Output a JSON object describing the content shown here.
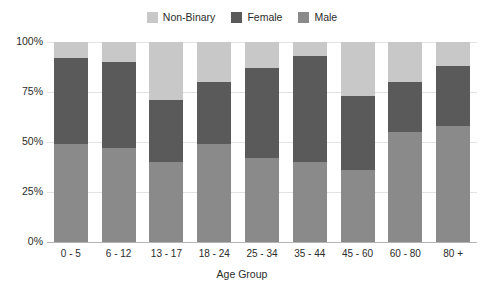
{
  "chart_data": {
    "type": "bar",
    "subtype": "stacked-bar-100-percent",
    "title": "",
    "xlabel": "Age Group",
    "ylabel": "",
    "ylim": [
      0,
      100
    ],
    "yticks": [
      "0%",
      "25%",
      "50%",
      "75%",
      "100%"
    ],
    "ytick_values": [
      0,
      25,
      50,
      75,
      100
    ],
    "grid": true,
    "legend_position": "top-center",
    "categories": [
      "0 - 5",
      "6 - 12",
      "13 - 17",
      "18 - 24",
      "25 - 34",
      "35 - 44",
      "45 - 60",
      "60 - 80",
      "80 +"
    ],
    "series": [
      {
        "name": "Male",
        "color": "#8a8a8a",
        "values": [
          49,
          47,
          40,
          49,
          42,
          40,
          36,
          55,
          58
        ]
      },
      {
        "name": "Female",
        "color": "#5a5a5a",
        "values": [
          43,
          43,
          31,
          31,
          45,
          53,
          37,
          25,
          30
        ]
      },
      {
        "name": "Non-Binary",
        "color": "#c8c8c8",
        "values": [
          8,
          10,
          29,
          20,
          13,
          7,
          27,
          20,
          12
        ]
      }
    ]
  },
  "legend": {
    "entries": [
      {
        "label": "Non-Binary",
        "color": "#c8c8c8"
      },
      {
        "label": "Female",
        "color": "#5a5a5a"
      },
      {
        "label": "Male",
        "color": "#8a8a8a"
      }
    ]
  },
  "axes": {
    "x_title": "Age Group",
    "y_ticks": [
      "100%",
      "75%",
      "50%",
      "25%",
      "0%"
    ],
    "x_ticks": [
      "0 - 5",
      "6 - 12",
      "13 - 17",
      "18 - 24",
      "25 - 34",
      "35 - 44",
      "45 - 60",
      "60 - 80",
      "80 +"
    ]
  },
  "colors": {
    "non_binary": "#c8c8c8",
    "female": "#5a5a5a",
    "male": "#8a8a8a",
    "grid": "#e3e3e3",
    "axis": "#b4b4b4",
    "text": "#2b2b2b",
    "background": "#ffffff"
  }
}
